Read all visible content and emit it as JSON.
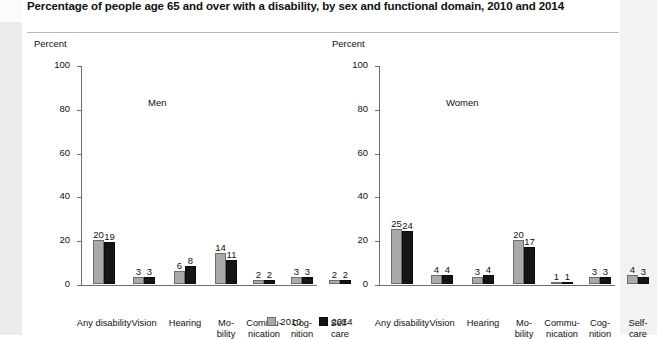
{
  "title": "Percentage of people age 65 and over with a disability, by sex and functional domain, 2010 and 2014",
  "legend": {
    "items": [
      {
        "label": "2010",
        "color": "#a9a9a9"
      },
      {
        "label": "2014",
        "color": "#151515"
      }
    ]
  },
  "axis": {
    "ylabel": "Percent",
    "yticks": [
      "0",
      "20",
      "40",
      "60",
      "80",
      "100"
    ]
  },
  "panels": [
    {
      "name": "Men"
    },
    {
      "name": "Women"
    }
  ],
  "chart_data": {
    "type": "bar",
    "title": "Percentage of people age 65 and over with a disability, by sex and functional domain, 2010 and 2014",
    "xlabel": "",
    "ylabel": "Percent",
    "ylim": [
      0,
      100
    ],
    "yticks": [
      0,
      20,
      40,
      60,
      80,
      100
    ],
    "grid": false,
    "legend_position": "bottom-center",
    "categories": [
      "Any disability",
      "Vision",
      "Hearing",
      "Mo-\nbility",
      "Commu-\nnication",
      "Cog-\nnition",
      "Self-\ncare"
    ],
    "panels": [
      {
        "name": "Men",
        "series": [
          {
            "name": "2010",
            "color": "#a9a9a9",
            "values": [
              20,
              3,
              6,
              14,
              2,
              3,
              2
            ]
          },
          {
            "name": "2014",
            "color": "#151515",
            "values": [
              19,
              3,
              8,
              11,
              2,
              3,
              2
            ]
          }
        ]
      },
      {
        "name": "Women",
        "series": [
          {
            "name": "2010",
            "color": "#a9a9a9",
            "values": [
              25,
              4,
              3,
              20,
              1,
              3,
              4
            ]
          },
          {
            "name": "2014",
            "color": "#151515",
            "values": [
              24,
              4,
              4,
              17,
              1,
              3,
              3
            ]
          }
        ]
      }
    ]
  }
}
